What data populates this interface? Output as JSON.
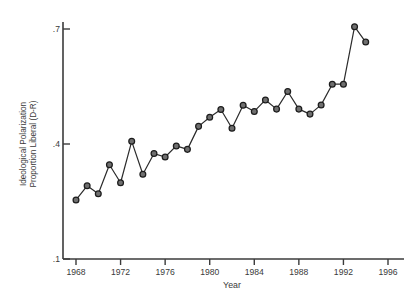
{
  "chart_data": {
    "type": "line",
    "title": "",
    "subtitle": "",
    "xlabel": "Year",
    "ylabel": "Ideological Polarization Proportion Liberal (D-R)",
    "ylabel_line1": "Ideological Polarization",
    "ylabel_line2": "Proportion Liberal (D-R)",
    "xlim": [
      1967,
      1997
    ],
    "ylim": [
      0.1,
      0.73
    ],
    "xticks": [
      1968,
      1972,
      1976,
      1980,
      1984,
      1988,
      1992,
      1996
    ],
    "xtick_labels": [
      "1968",
      "1972",
      "1976",
      "1980",
      "1984",
      "1988",
      "1992",
      "1996"
    ],
    "yticks": [
      0.1,
      0.4,
      0.7
    ],
    "ytick_labels": [
      ".1",
      ".4",
      ".7"
    ],
    "grid": false,
    "legend": null,
    "marker": "circle-open",
    "line_color": "#2b2b2b",
    "marker_fill": "#6f6f6f",
    "marker_edge": "#1c1c1c",
    "axis_color": "#3b3b3b",
    "background": "#ffffff",
    "x": [
      1968,
      1969,
      1970,
      1971,
      1972,
      1973,
      1974,
      1975,
      1976,
      1977,
      1978,
      1979,
      1980,
      1981,
      1982,
      1983,
      1984,
      1985,
      1986,
      1987,
      1988,
      1989,
      1990,
      1991,
      1992,
      1993,
      1994
    ],
    "values": [
      0.254,
      0.291,
      0.27,
      0.346,
      0.299,
      0.407,
      0.321,
      0.375,
      0.366,
      0.395,
      0.386,
      0.446,
      0.47,
      0.49,
      0.441,
      0.501,
      0.485,
      0.515,
      0.491,
      0.537,
      0.491,
      0.478,
      0.502,
      0.556,
      0.556,
      0.706,
      0.666
    ],
    "series": [
      {
        "name": "Ideological Polarization",
        "values": [
          0.254,
          0.291,
          0.27,
          0.346,
          0.299,
          0.407,
          0.321,
          0.375,
          0.366,
          0.395,
          0.386,
          0.446,
          0.47,
          0.49,
          0.441,
          0.501,
          0.485,
          0.515,
          0.491,
          0.537,
          0.491,
          0.478,
          0.502,
          0.556,
          0.556,
          0.706,
          0.666
        ]
      }
    ],
    "n_points": 27
  }
}
